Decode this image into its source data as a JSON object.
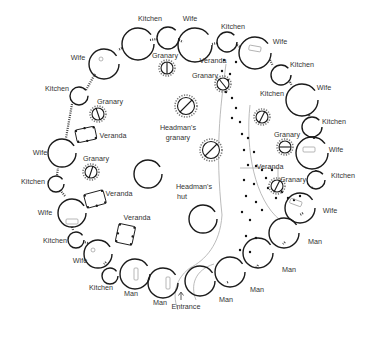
{
  "diagram": {
    "type": "compound plan",
    "background": "#ffffff",
    "stroke_color": "#1a1a1a",
    "labels": [
      {
        "id": "kitchen-top-1",
        "text": "Kitchen",
        "x": 150,
        "y": 21
      },
      {
        "id": "wife-top-1",
        "text": "Wife",
        "x": 190,
        "y": 21
      },
      {
        "id": "kitchen-top-2",
        "text": "Kitchen",
        "x": 222,
        "y": 29
      },
      {
        "id": "granary-top-1",
        "text": "Granary",
        "x": 156,
        "y": 58
      },
      {
        "id": "wife-top-left",
        "text": "Wife",
        "x": 72,
        "y": 60
      },
      {
        "id": "veranda-top",
        "text": "Veranda",
        "x": 205,
        "y": 62
      },
      {
        "id": "granary-top-2",
        "text": "Granary",
        "x": 192,
        "y": 78
      },
      {
        "id": "wife-top-right",
        "text": "Wife",
        "x": 272,
        "y": 44
      },
      {
        "id": "kitchen-right-1",
        "text": "Kitchen",
        "x": 290,
        "y": 67
      },
      {
        "id": "wife-right-1",
        "text": "Wife",
        "x": 317,
        "y": 90
      },
      {
        "id": "kitchen-upper-left",
        "text": "Kitchen",
        "x": 44,
        "y": 91
      },
      {
        "id": "granary-upper-left",
        "text": "Granary",
        "x": 97,
        "y": 104
      },
      {
        "id": "headmans-granary",
        "text": "Headman's",
        "x": 178,
        "y": 130
      },
      {
        "id": "headmans-granary-2",
        "text": "granary",
        "x": 178,
        "y": 140
      },
      {
        "id": "kitchen-center",
        "text": "Kitchen",
        "x": 262,
        "y": 95
      },
      {
        "id": "kitchen-right-2",
        "text": "Kitchen",
        "x": 323,
        "y": 122
      },
      {
        "id": "veranda-upper-left",
        "text": "Veranda",
        "x": 100,
        "y": 137
      },
      {
        "id": "granary-right-1",
        "text": "Granary",
        "x": 274,
        "y": 137
      },
      {
        "id": "wife-right-2",
        "text": "Wife",
        "x": 330,
        "y": 152
      },
      {
        "id": "wife-left-1",
        "text": "Wife",
        "x": 27,
        "y": 155
      },
      {
        "id": "granary-left",
        "text": "Granary",
        "x": 83,
        "y": 161
      },
      {
        "id": "veranda-right",
        "text": "Veranda",
        "x": 258,
        "y": 168
      },
      {
        "id": "granary-right-2",
        "text": "Granary",
        "x": 285,
        "y": 181
      },
      {
        "id": "kitchen-right-3",
        "text": "Kitchen",
        "x": 332,
        "y": 178
      },
      {
        "id": "kitchen-left-1",
        "text": "Kitchen",
        "x": 20,
        "y": 184
      },
      {
        "id": "veranda-left-1",
        "text": "Veranda",
        "x": 107,
        "y": 196
      },
      {
        "id": "headmans-hut",
        "text": "Headman's",
        "x": 178,
        "y": 193
      },
      {
        "id": "headmans-hut-2",
        "text": "hut",
        "x": 178,
        "y": 203
      },
      {
        "id": "wife-left-2",
        "text": "Wife",
        "x": 38,
        "y": 215
      },
      {
        "id": "wife-right-3",
        "text": "Wife",
        "x": 323,
        "y": 213
      },
      {
        "id": "veranda-left-2",
        "text": "Veranda",
        "x": 125,
        "y": 220
      },
      {
        "id": "kitchen-left-2",
        "text": "Kitchen",
        "x": 42,
        "y": 243
      },
      {
        "id": "man-right-1",
        "text": "Man",
        "x": 310,
        "y": 243
      },
      {
        "id": "wife-left-3",
        "text": "Wife",
        "x": 73,
        "y": 262
      },
      {
        "id": "man-right-2",
        "text": "Man",
        "x": 283,
        "y": 271
      },
      {
        "id": "kitchen-bottom",
        "text": "Kitchen",
        "x": 89,
        "y": 289
      },
      {
        "id": "man-bottom-1",
        "text": "Man",
        "x": 122,
        "y": 296
      },
      {
        "id": "man-bottom-2",
        "text": "Man",
        "x": 255,
        "y": 291
      },
      {
        "id": "man-bottom-3",
        "text": "Man",
        "x": 153,
        "y": 305
      },
      {
        "id": "man-bottom-4",
        "text": "Man",
        "x": 218,
        "y": 301
      },
      {
        "id": "entrance",
        "text": "Entrance",
        "x": 175,
        "y": 309
      }
    ],
    "huts": [
      {
        "cx": 138,
        "cy": 44,
        "r": 16
      },
      {
        "cx": 168,
        "cy": 38,
        "r": 11
      },
      {
        "cx": 195,
        "cy": 45,
        "r": 17
      },
      {
        "cx": 227,
        "cy": 42,
        "r": 10
      },
      {
        "cx": 255,
        "cy": 53,
        "r": 16
      },
      {
        "cx": 281,
        "cy": 75,
        "r": 10
      },
      {
        "cx": 302,
        "cy": 100,
        "r": 16
      },
      {
        "cx": 312,
        "cy": 127,
        "r": 10
      },
      {
        "cx": 312,
        "cy": 153,
        "r": 16
      },
      {
        "cx": 316,
        "cy": 180,
        "r": 9
      },
      {
        "cx": 308,
        "cy": 200,
        "r": 15
      },
      {
        "cx": 294,
        "cy": 229,
        "r": 15
      },
      {
        "cx": 271,
        "cy": 256,
        "r": 15
      },
      {
        "cx": 243,
        "cy": 278,
        "r": 15
      },
      {
        "cx": 212,
        "cy": 284,
        "r": 15
      },
      {
        "cx": 164,
        "cy": 283,
        "r": 15
      },
      {
        "cx": 133,
        "cy": 276,
        "r": 15
      },
      {
        "cx": 110,
        "cy": 275,
        "r": 8
      },
      {
        "cx": 98,
        "cy": 253,
        "r": 14
      },
      {
        "cx": 76,
        "cy": 239,
        "r": 8
      },
      {
        "cx": 71,
        "cy": 213,
        "r": 14
      },
      {
        "cx": 56,
        "cy": 183,
        "r": 8
      },
      {
        "cx": 62,
        "cy": 154,
        "r": 14
      },
      {
        "cx": 78,
        "cy": 95,
        "r": 8
      },
      {
        "cx": 103,
        "cy": 64,
        "r": 14
      },
      {
        "cx": 148,
        "cy": 175,
        "r": 14
      },
      {
        "cx": 203,
        "cy": 218,
        "r": 14
      }
    ],
    "granaries": [
      {
        "cx": 167,
        "cy": 68,
        "r": 6
      },
      {
        "cx": 98,
        "cy": 114,
        "r": 6
      },
      {
        "cx": 186,
        "cy": 107,
        "r": 9
      },
      {
        "cx": 211,
        "cy": 150,
        "r": 9
      },
      {
        "cx": 91,
        "cy": 172,
        "r": 6
      },
      {
        "cx": 223,
        "cy": 84,
        "r": 6
      },
      {
        "cx": 262,
        "cy": 117,
        "r": 6
      },
      {
        "cx": 285,
        "cy": 147,
        "r": 6
      },
      {
        "cx": 276,
        "cy": 186,
        "r": 6
      }
    ],
    "verandas": [
      {
        "x": 76,
        "y": 128,
        "w": 20,
        "h": 13,
        "rot": -12
      },
      {
        "x": 85,
        "y": 192,
        "w": 20,
        "h": 14,
        "rot": -15
      },
      {
        "x": 117,
        "y": 225,
        "w": 17,
        "h": 19,
        "rot": 12
      }
    ]
  }
}
